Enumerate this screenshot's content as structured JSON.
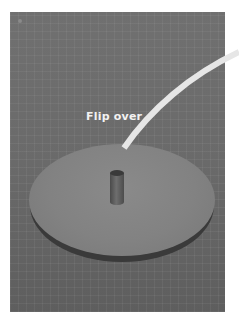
{
  "image": {
    "description": "Photo of a cardboard disc with a small cylinder on a gray grid cutting mat, with an instruction label",
    "label": "Flip over",
    "colors": {
      "mat": "#6d6d6d",
      "disc": "#858585",
      "label": "#f2f2f2",
      "curve": "#e6e6e6",
      "background": "#ffffff"
    },
    "icons": [
      "curved-pointer-line"
    ]
  }
}
